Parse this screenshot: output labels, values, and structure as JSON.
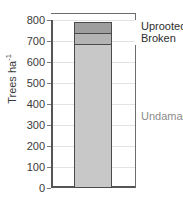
{
  "chart_data": {
    "type": "bar",
    "subtype": "stacked-bar-single-category",
    "title": "",
    "xlabel": "",
    "ylabel": "Trees ha",
    "ylabel_exponent": "-1",
    "categories": [
      ""
    ],
    "ylim": [
      0,
      800
    ],
    "yticks": [
      0,
      100,
      200,
      300,
      400,
      500,
      600,
      700,
      800
    ],
    "ytick_labels": [
      "0",
      "100",
      "200",
      "300",
      "400",
      "500",
      "600",
      "700",
      "800"
    ],
    "grid": true,
    "grid_axis": "y",
    "legend_position": "right-inline-annotations",
    "total": 800,
    "series": [
      {
        "name": "Undamaged",
        "values": [
          683
        ],
        "y0": 0,
        "y1": 683,
        "color": "#c8c8c8",
        "label_color": "#8c8c8c"
      },
      {
        "name": "Broken",
        "values": [
          62
        ],
        "y0": 683,
        "y1": 745,
        "color": "#b4b4b4",
        "label_color": "#2e2e2e"
      },
      {
        "name": "Uprooted",
        "values": [
          55
        ],
        "y0": 745,
        "y1": 800,
        "color": "#9e9e9e",
        "label_color": "#2e2e2e"
      }
    ],
    "annotations": [
      {
        "text": "Uprooted",
        "target_series": "Uprooted",
        "y_value": 772
      },
      {
        "text": "Broken",
        "target_series": "Broken",
        "y_value": 714
      },
      {
        "text": "Undamaged",
        "target_series": "Undamaged",
        "y_value": 342
      }
    ],
    "colors": {
      "axis": "#555555",
      "grid": "#e3e3e3",
      "bar_outline": "#4a4a4a",
      "bracket": "#6b6b6b",
      "tick_text": "#3a3a3a"
    }
  }
}
